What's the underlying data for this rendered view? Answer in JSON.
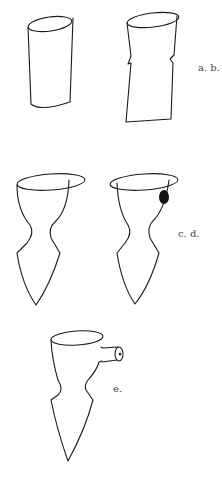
{
  "figures": [
    {
      "id": "a",
      "name": "straight-cylinder"
    },
    {
      "id": "b",
      "name": "notched-cylinder"
    },
    {
      "id": "c",
      "name": "waisted-pointed-vessel"
    },
    {
      "id": "d",
      "name": "waisted-pointed-vessel-with-hole"
    },
    {
      "id": "e",
      "name": "waisted-pointed-vessel-with-spout"
    }
  ],
  "labels": {
    "ab": "a. b.",
    "cd": "c. d.",
    "e": "e."
  },
  "colors": {
    "stroke": "#1a1a1a",
    "label": "#444444",
    "background": "#ffffff"
  }
}
